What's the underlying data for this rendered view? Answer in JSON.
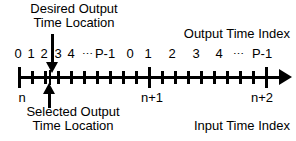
{
  "diagram": {
    "accent_color": "#000000",
    "background_color": "#ffffff"
  },
  "callouts": {
    "desired": {
      "line1": "Desired Output",
      "line2": "Time Location",
      "pointer": "down-arrow"
    },
    "selected": {
      "line1": "Selected Output",
      "line2": "Time Location",
      "pointer": "up-arrow"
    }
  },
  "axis_labels": {
    "output_time_index": "Output Time Index",
    "input_time_index": "Input Time Index"
  },
  "output_index_groups": [
    {
      "frame": "n",
      "labels": [
        "0",
        "1",
        "2",
        "3",
        "4",
        "⋯",
        "P-1"
      ],
      "positions": [
        18,
        31,
        44,
        57,
        70,
        84,
        100
      ]
    },
    {
      "frame": "n+1",
      "labels": [
        "0",
        "1",
        "2",
        "3",
        "4",
        "⋯",
        "P-1"
      ],
      "positions": [
        148,
        163,
        178,
        193,
        208,
        225,
        247
      ]
    }
  ],
  "frame_indices": [
    {
      "label": "n",
      "x": 22
    },
    {
      "label": "n+1",
      "x": 152
    },
    {
      "label": "n+2",
      "x": 262
    }
  ],
  "axis": {
    "start_x": 18,
    "end_x": 286,
    "y": 76,
    "arrow": "right-arrow",
    "major_ticks": [
      18,
      148,
      265
    ],
    "minor_ticks": [
      31,
      44,
      52,
      65,
      78,
      91,
      104,
      117,
      130,
      161,
      174,
      187,
      200,
      213,
      226,
      239,
      252
    ],
    "selected_tick_x": 50
  },
  "markers": {
    "desired_output_x": 52,
    "selected_output_x": 50
  }
}
